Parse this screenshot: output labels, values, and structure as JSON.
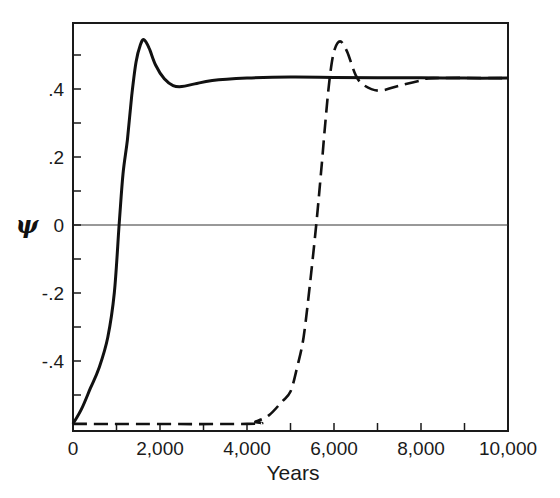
{
  "chart_data": {
    "type": "line",
    "title": "",
    "xlabel": "Years",
    "ylabel": "ψ",
    "xlim": [
      0,
      10000
    ],
    "ylim": [
      -0.6,
      0.6
    ],
    "grid": false,
    "legend": null,
    "x_ticks": [
      0,
      2000,
      4000,
      6000,
      8000,
      10000
    ],
    "x_tick_labels": [
      "0",
      "2,000",
      "4,000",
      "6,000",
      "8,000",
      "10,000"
    ],
    "x_minor_ticks": [
      1000,
      3000,
      5000,
      7000,
      9000
    ],
    "y_ticks": [
      0.4,
      0.2,
      0,
      -0.2,
      -0.4
    ],
    "y_tick_labels": [
      ".4",
      ".2",
      "0",
      "-.2",
      "-.4"
    ],
    "y_minor_ticks": [
      0.5,
      0.3,
      0.1,
      -0.1,
      -0.3,
      -0.5
    ],
    "reference_line": {
      "y": 0
    },
    "series": [
      {
        "name": "solid",
        "style": "solid",
        "x": [
          0,
          200,
          400,
          600,
          800,
          950,
          1060,
          1150,
          1250,
          1350,
          1450,
          1550,
          1630,
          1750,
          1900,
          2100,
          2300,
          2500,
          2800,
          3200,
          4000,
          5000,
          6000,
          7000,
          8000,
          9000,
          10000
        ],
        "y": [
          -0.585,
          -0.54,
          -0.48,
          -0.42,
          -0.33,
          -0.2,
          0,
          0.15,
          0.25,
          0.38,
          0.48,
          0.53,
          0.545,
          0.52,
          0.47,
          0.43,
          0.41,
          0.407,
          0.415,
          0.425,
          0.432,
          0.435,
          0.434,
          0.433,
          0.433,
          0.432,
          0.432
        ]
      },
      {
        "name": "dashed",
        "style": "dashed",
        "x": [
          0,
          4000,
          4200,
          4500,
          4800,
          5000,
          5150,
          5300,
          5450,
          5590,
          5700,
          5800,
          5900,
          6000,
          6140,
          6300,
          6500,
          6700,
          7050,
          7500,
          8000,
          8300,
          10000
        ],
        "y": [
          -0.585,
          -0.585,
          -0.578,
          -0.56,
          -0.52,
          -0.49,
          -0.42,
          -0.33,
          -0.17,
          0,
          0.15,
          0.3,
          0.43,
          0.51,
          0.54,
          0.51,
          0.44,
          0.41,
          0.395,
          0.41,
          0.425,
          0.432,
          0.432
        ]
      }
    ]
  },
  "labels": {
    "xlabel": "Years",
    "ylabel": "ψ",
    "x_ticks": [
      "0",
      "2,000",
      "4,000",
      "6,000",
      "8,000",
      "10,000"
    ],
    "y_ticks": [
      ".4",
      ".2",
      "0",
      "-.2",
      "-.4"
    ]
  }
}
